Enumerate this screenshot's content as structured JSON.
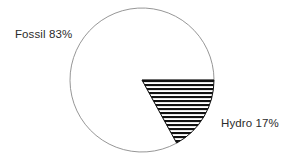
{
  "chart_data": {
    "type": "pie",
    "title": "",
    "subtitle": "",
    "xlabel": "",
    "ylabel": "",
    "legend_position": "none",
    "grid": false,
    "labels_inline": true,
    "start_angle_deg": 0,
    "direction": "clockwise",
    "categories": [
      "Fossil",
      "Hydro"
    ],
    "values": [
      83,
      17
    ],
    "value_unit": "%",
    "slices": [
      {
        "name": "Fossil",
        "value": 83,
        "label": "Fossil 83%",
        "fill": "white",
        "fill_color": "#ffffff",
        "stroke_color": "#8a8a8a",
        "start_angle_deg": 61.2,
        "end_angle_deg": 360
      },
      {
        "name": "Hydro",
        "value": 17,
        "label": "Hydro 17%",
        "fill": "horizontal-stripe-hatch",
        "fill_color": "#111111",
        "stroke_color": "#111111",
        "start_angle_deg": 0,
        "end_angle_deg": 61.2
      }
    ],
    "annotations": [
      "Fossil 83%",
      "Hydro 17%"
    ]
  },
  "labels": {
    "fossil": "Fossil 83%",
    "hydro": "Hydro 17%"
  },
  "colors": {
    "background": "#ffffff",
    "outline": "#8a8a8a",
    "hatch": "#111111",
    "text": "#2b2b2b"
  },
  "geometry": {
    "center_x": 142,
    "center_y": 80,
    "radius": 72
  }
}
